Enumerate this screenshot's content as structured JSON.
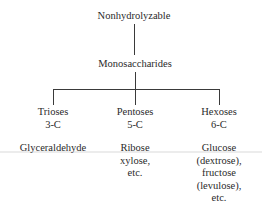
{
  "diagram": {
    "root": {
      "label": "Nonhydrolyzable"
    },
    "level2": {
      "label": "Monosaccharides"
    },
    "branches": [
      {
        "name": "Trioses",
        "carbon": "3-C",
        "examples": [
          "Glyceraldehyde"
        ]
      },
      {
        "name": "Pentoses",
        "carbon": "5-C",
        "examples": [
          "Ribose",
          "xylose,",
          "etc."
        ]
      },
      {
        "name": "Hexoses",
        "carbon": "6-C",
        "examples": [
          "Glucose",
          "(dextrose),",
          "fructose",
          "(levulose),",
          "etc."
        ]
      }
    ],
    "colors": {
      "line": "#3a3a3a",
      "text": "#2a2a2a",
      "background": "#ffffff"
    }
  }
}
